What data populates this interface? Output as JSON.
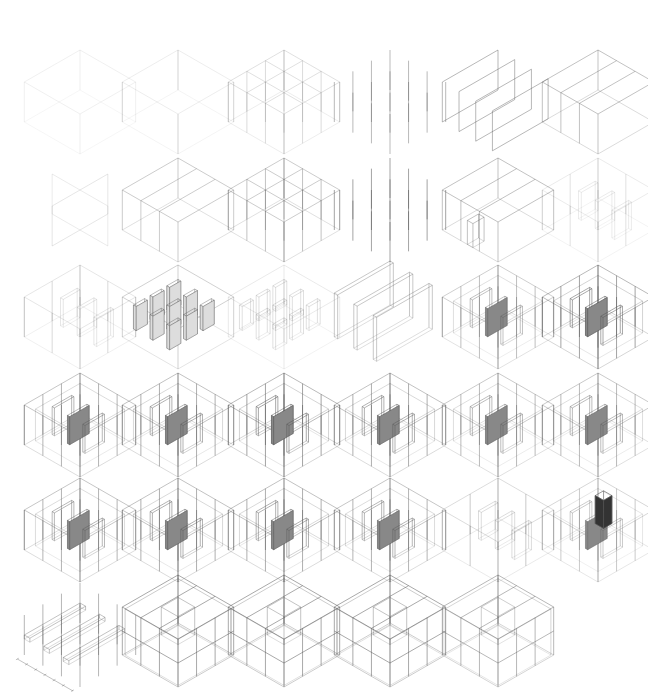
{
  "figure": {
    "type": "isometric-architectural-diagram-sequence",
    "rows": 6,
    "columns": 6,
    "panel_count": 35,
    "line_color": "#555555",
    "heavy_fill_color": "#333333"
  },
  "panels": [
    {
      "row": 0,
      "col": 0,
      "kind": "box",
      "weight": 0.15
    },
    {
      "row": 0,
      "col": 1,
      "kind": "box-posts",
      "weight": 0.18
    },
    {
      "row": 0,
      "col": 2,
      "kind": "grid-frame",
      "weight": 0.3
    },
    {
      "row": 0,
      "col": 3,
      "kind": "posts",
      "weight": 0.45
    },
    {
      "row": 0,
      "col": 4,
      "kind": "planes",
      "weight": 0.7
    },
    {
      "row": 0,
      "col": 5,
      "kind": "bays",
      "weight": 0.6
    },
    {
      "row": 1,
      "col": 0,
      "kind": "cross-walls",
      "weight": 0.25
    },
    {
      "row": 1,
      "col": 1,
      "kind": "bays-open",
      "weight": 0.5
    },
    {
      "row": 1,
      "col": 2,
      "kind": "grid-frame",
      "weight": 0.5
    },
    {
      "row": 1,
      "col": 3,
      "kind": "posts",
      "weight": 0.6
    },
    {
      "row": 1,
      "col": 4,
      "kind": "bays-cut",
      "weight": 0.6
    },
    {
      "row": 1,
      "col": 5,
      "kind": "faint-mix",
      "weight": 0.2
    },
    {
      "row": 2,
      "col": 0,
      "kind": "faint-mix",
      "weight": 0.25
    },
    {
      "row": 2,
      "col": 1,
      "kind": "box-fins",
      "weight": 0.65
    },
    {
      "row": 2,
      "col": 2,
      "kind": "box-fins",
      "weight": 0.3
    },
    {
      "row": 2,
      "col": 3,
      "kind": "slabs",
      "weight": 0.55
    },
    {
      "row": 2,
      "col": 4,
      "kind": "complex",
      "weight": 0.6
    },
    {
      "row": 2,
      "col": 5,
      "kind": "complex",
      "weight": 0.85
    },
    {
      "row": 3,
      "col": 0,
      "kind": "complex",
      "weight": 0.7
    },
    {
      "row": 3,
      "col": 1,
      "kind": "complex",
      "weight": 0.75
    },
    {
      "row": 3,
      "col": 2,
      "kind": "complex",
      "weight": 0.85
    },
    {
      "row": 3,
      "col": 3,
      "kind": "complex",
      "weight": 0.75
    },
    {
      "row": 3,
      "col": 4,
      "kind": "complex",
      "weight": 0.65
    },
    {
      "row": 3,
      "col": 5,
      "kind": "complex",
      "weight": 0.65
    },
    {
      "row": 4,
      "col": 0,
      "kind": "complex",
      "weight": 0.7
    },
    {
      "row": 4,
      "col": 1,
      "kind": "complex",
      "weight": 0.75
    },
    {
      "row": 4,
      "col": 2,
      "kind": "complex",
      "weight": 0.75
    },
    {
      "row": 4,
      "col": 3,
      "kind": "complex",
      "weight": 0.7
    },
    {
      "row": 4,
      "col": 4,
      "kind": "faint-mix",
      "weight": 0.35
    },
    {
      "row": 4,
      "col": 5,
      "kind": "complex-block",
      "weight": 0.5
    },
    {
      "row": 5,
      "col": 0,
      "kind": "dimensioned",
      "weight": 0.6
    },
    {
      "row": 5,
      "col": 1,
      "kind": "full-house",
      "weight": 0.85
    },
    {
      "row": 5,
      "col": 2,
      "kind": "full-house",
      "weight": 0.85
    },
    {
      "row": 5,
      "col": 3,
      "kind": "full-house",
      "weight": 0.85
    },
    {
      "row": 5,
      "col": 4,
      "kind": "full-house",
      "weight": 0.7
    }
  ]
}
